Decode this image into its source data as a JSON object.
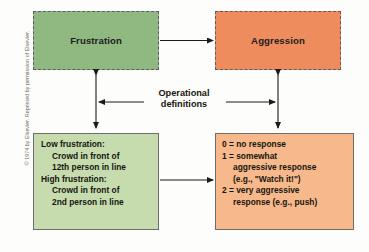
{
  "figure": {
    "copyright": "© 1974 by Elsevier. Reprinted by permission of Elsevier.",
    "middle_label_line1": "Operational",
    "middle_label_line2": "definitions"
  },
  "boxes": {
    "frustration": {
      "label": "Frustration",
      "fill": "#8fb981",
      "border_style": "dashed"
    },
    "aggression": {
      "label": "Aggression",
      "fill": "#ef8c5e",
      "border_style": "dashed"
    },
    "frustration_ops": {
      "fill": "#c6dcae",
      "border_style": "solid",
      "lines": [
        {
          "text": "Low frustration:",
          "indent": 0
        },
        {
          "text": "Crowd in front of",
          "indent": 1
        },
        {
          "text": "12th person in line",
          "indent": 1
        },
        {
          "text": "High frustration:",
          "indent": 0
        },
        {
          "text": "Crowd in front of",
          "indent": 1
        },
        {
          "text": "2nd person in line",
          "indent": 1
        }
      ]
    },
    "aggression_ops": {
      "fill": "#f7b98c",
      "border_style": "solid",
      "lines": [
        {
          "text": "0 = no response",
          "indent": 0
        },
        {
          "text": "1 = somewhat",
          "indent": 0
        },
        {
          "text": "aggressive response",
          "indent": 1
        },
        {
          "text": "(e.g., \"Watch it!\")",
          "indent": 1
        },
        {
          "text": "2 =  very aggressive",
          "indent": 0
        },
        {
          "text": "response (e.g., push)",
          "indent": 1
        }
      ]
    }
  },
  "arrows": {
    "top_horizontal": "frustration-to-aggression",
    "left_vertical": "frustration-double-headed",
    "right_vertical": "aggression-double-headed",
    "bottom_horizontal": "frustration-ops-to-aggression-ops",
    "label_left_connector": "operational-definitions-left",
    "label_right_connector": "operational-definitions-right"
  },
  "colors": {
    "line": "#1b1b1b",
    "dashed_border": "#5c5c5c",
    "solid_border": "#6d6d6d",
    "background": "#fdfdfb"
  }
}
